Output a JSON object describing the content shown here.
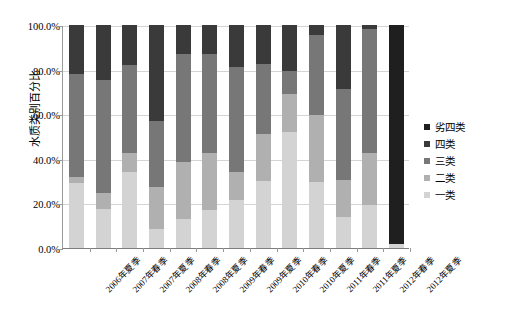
{
  "chart_data": {
    "type": "bar",
    "stacked": true,
    "stack_mode": "percent",
    "title": "",
    "xlabel": "",
    "ylabel": "水质类别百分比",
    "ylim": [
      0,
      100
    ],
    "ytick_labels": [
      "100.0%",
      "80.0%",
      "60.0%",
      "40.0%",
      "20.0%",
      "0.0%"
    ],
    "ytick_values": [
      100,
      80,
      60,
      40,
      20,
      0
    ],
    "grid": true,
    "legend_position": "right",
    "categories": [
      "2006年夏季",
      "2007年春季",
      "2007年夏季",
      "2008年春季",
      "2008年夏季",
      "2009年春季",
      "2009年夏季",
      "2010年春季",
      "2010年夏季",
      "2011年春季",
      "2011年夏季",
      "2012年春季",
      "2012年夏季"
    ],
    "series": [
      {
        "name": "一类",
        "color": "#d3d3d3",
        "values": [
          29.0,
          17.5,
          34.0,
          8.5,
          13.0,
          17.0,
          21.5,
          30.0,
          52.0,
          29.5,
          14.0,
          19.5,
          2.0
        ]
      },
      {
        "name": "二类",
        "color": "#b0b0b0",
        "values": [
          3.0,
          7.0,
          8.5,
          19.0,
          25.5,
          25.5,
          12.5,
          21.0,
          17.0,
          30.0,
          16.5,
          23.0,
          0.0
        ]
      },
      {
        "name": "三类",
        "color": "#777777",
        "values": [
          46.0,
          51.0,
          39.5,
          29.5,
          48.5,
          44.5,
          47.0,
          31.5,
          10.5,
          36.0,
          41.0,
          55.5,
          0.0
        ]
      },
      {
        "name": "四类",
        "color": "#3a3a3a",
        "values": [
          22.0,
          24.5,
          18.0,
          43.0,
          13.0,
          13.0,
          19.0,
          17.5,
          20.5,
          4.5,
          28.5,
          2.0,
          0.0
        ]
      },
      {
        "name": "劣四类",
        "color": "#1f1f1f",
        "values": [
          0.0,
          0.0,
          0.0,
          0.0,
          0.0,
          0.0,
          0.0,
          0.0,
          0.0,
          0.0,
          0.0,
          0.0,
          98.0
        ]
      }
    ],
    "legend_entries": [
      {
        "label": "劣四类",
        "color": "#1f1f1f"
      },
      {
        "label": "四类",
        "color": "#3a3a3a"
      },
      {
        "label": "三类",
        "color": "#777777"
      },
      {
        "label": "二类",
        "color": "#b0b0b0"
      },
      {
        "label": "一类",
        "color": "#d3d3d3"
      }
    ]
  }
}
